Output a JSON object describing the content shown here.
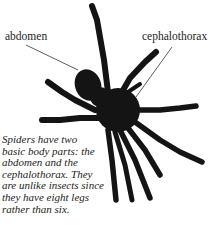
{
  "labels": {
    "abdomen": "abdomen",
    "cephalothorax": "cephalothorax"
  },
  "caption": {
    "lines": [
      "Spiders have two",
      "basic body parts: the",
      "abdomen and the",
      "cephalothorax. They",
      "are unlike insects since",
      "they have eight legs",
      "rather than six."
    ]
  },
  "colors": {
    "spider": "#141414",
    "text": "#222222",
    "leader_line": "#333333",
    "background": "#ffffff"
  }
}
